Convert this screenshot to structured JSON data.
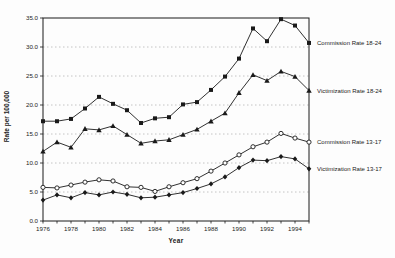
{
  "chart_data": {
    "type": "line",
    "title": "",
    "xlabel": "Year",
    "ylabel": "Rate per 100,000",
    "x": [
      1976,
      1977,
      1978,
      1979,
      1980,
      1981,
      1982,
      1983,
      1984,
      1985,
      1986,
      1987,
      1988,
      1989,
      1990,
      1991,
      1992,
      1993,
      1994,
      1995
    ],
    "x_tick_labels": [
      "1976",
      "1978",
      "1980",
      "1982",
      "1984",
      "1986",
      "1988",
      "1990",
      "1992",
      "1994"
    ],
    "x_labeled_years": [
      1976,
      1978,
      1980,
      1982,
      1984,
      1986,
      1988,
      1990,
      1992,
      1994
    ],
    "xlim": [
      1976,
      1995
    ],
    "y_ticks": [
      0,
      5,
      10,
      15,
      20,
      25,
      30,
      35
    ],
    "y_tick_labels": [
      "0.0",
      "5.0",
      "10.0",
      "15.0",
      "20.0",
      "25.0",
      "30.0",
      "35.0"
    ],
    "ylim": [
      0,
      35
    ],
    "grid": "horizontal-dashed",
    "legend_position": "right-inline-labels",
    "series": [
      {
        "name": "Commission Rate 18-24",
        "marker": "square-filled",
        "values": [
          17.2,
          17.2,
          17.6,
          19.4,
          21.4,
          20.2,
          19.1,
          16.9,
          17.7,
          17.9,
          20.1,
          20.5,
          22.6,
          24.9,
          28.0,
          33.2,
          31.0,
          34.8,
          33.7,
          30.7
        ]
      },
      {
        "name": "Victimization Rate 18-24",
        "marker": "triangle-filled",
        "values": [
          12.0,
          13.6,
          12.7,
          15.9,
          15.7,
          16.4,
          14.9,
          13.4,
          13.8,
          14.0,
          14.9,
          15.8,
          17.2,
          18.6,
          22.1,
          25.2,
          24.2,
          25.8,
          24.9,
          22.5
        ]
      },
      {
        "name": "Commission  Rate 13-17",
        "marker": "circle-open",
        "values": [
          5.8,
          5.7,
          6.2,
          6.7,
          7.1,
          6.9,
          5.9,
          5.8,
          5.1,
          5.9,
          6.6,
          7.3,
          8.6,
          10.0,
          11.4,
          12.8,
          13.6,
          15.1,
          14.3,
          13.6
        ]
      },
      {
        "name": "Victimization Rate 13-17",
        "marker": "diamond-filled",
        "values": [
          3.6,
          4.5,
          4.0,
          4.9,
          4.5,
          5.0,
          4.6,
          4.0,
          4.1,
          4.5,
          4.9,
          5.6,
          6.4,
          7.6,
          9.2,
          10.5,
          10.4,
          11.1,
          10.7,
          9.0
        ]
      }
    ]
  }
}
